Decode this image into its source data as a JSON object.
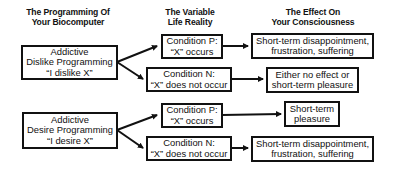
{
  "headers": {
    "programming": [
      "The Programming Of",
      "Your Biocomputer"
    ],
    "reality": [
      "The Variable",
      "Life Reality"
    ],
    "effect": [
      "The Effect On",
      "Your Consciousness"
    ]
  },
  "groups": [
    {
      "programming": [
        "Addictive",
        "Dislike Programming",
        "“I dislike X”"
      ],
      "conditions": [
        {
          "label": [
            "Condition P:",
            "“X” occurs"
          ],
          "effect": [
            "Short-term disappointment,",
            "frustration, suffering"
          ]
        },
        {
          "label": [
            "Condition N:",
            "“X” does not occur"
          ],
          "effect": [
            "Either no effect or",
            "short-term pleasure"
          ]
        }
      ]
    },
    {
      "programming": [
        "Addictive",
        "Desire Programming",
        "“I desire X”"
      ],
      "conditions": [
        {
          "label": [
            "Condition P:",
            "“X” occurs"
          ],
          "effect": [
            "Short-term",
            "pleasure"
          ]
        },
        {
          "label": [
            "Condition N:",
            "“X” does not occur"
          ],
          "effect": [
            "Short-term disappointment,",
            "frustration, suffering"
          ]
        }
      ]
    }
  ]
}
